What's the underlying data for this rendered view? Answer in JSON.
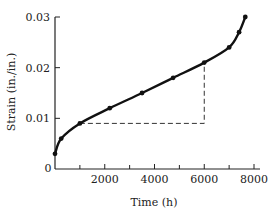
{
  "chart_data": {
    "type": "line",
    "title": "",
    "xlabel": "Time (h)",
    "ylabel": "Strain (in./in.)",
    "xlim": [
      0,
      8000
    ],
    "ylim": [
      0,
      0.03
    ],
    "x_ticks": [
      0,
      2000,
      4000,
      6000,
      8000
    ],
    "x_minor_ticks": [
      1000,
      3000,
      5000,
      7000
    ],
    "x_tick_labels": [
      "0",
      "2000",
      "4000",
      "6000",
      "8000"
    ],
    "y_ticks": [
      0.01,
      0.02,
      0.03
    ],
    "y_tick_labels": [
      "0.01",
      "0.02",
      "0.03"
    ],
    "grid": false,
    "legend": null,
    "series": [
      {
        "name": "Creep strain",
        "x": [
          0,
          250,
          1000,
          2200,
          3500,
          4750,
          6000,
          7000,
          7400,
          7650
        ],
        "y": [
          0.003,
          0.006,
          0.009,
          0.012,
          0.015,
          0.018,
          0.021,
          0.024,
          0.027,
          0.03
        ]
      }
    ],
    "annotations": [
      {
        "type": "dashed-triangle",
        "description": "Slope construction for steady-state creep rate",
        "points": [
          [
            1000,
            0.009
          ],
          [
            6000,
            0.009
          ],
          [
            6000,
            0.021
          ]
        ]
      }
    ]
  },
  "labels": {
    "origin": "0",
    "x_axis": "Time (h)",
    "y_axis": "Strain (in./in.)"
  }
}
